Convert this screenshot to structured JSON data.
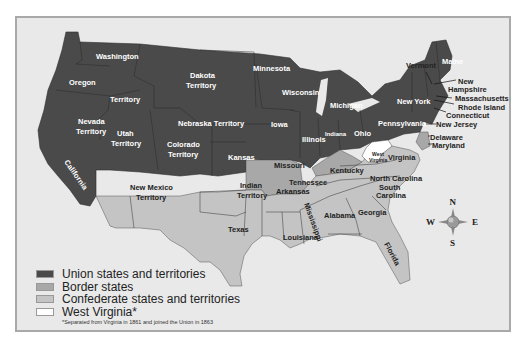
{
  "colors": {
    "union": "#4a4a4a",
    "border": "#a8a8a8",
    "confederate": "#c4c4c4",
    "west_virginia": "#ffffff",
    "background": "#e9e9e9"
  },
  "map": {
    "regions": {
      "washington": "Washington",
      "oregon": "Oregon",
      "territory": "Territory",
      "dakota": [
        "Dakota",
        "Territory"
      ],
      "minnesota": "Minnesota",
      "wisconsin": "Wisconsin",
      "michigan": "Michigan",
      "nevada": [
        "Nevada",
        "Territory"
      ],
      "utah": [
        "Utah",
        "Territory"
      ],
      "nebraska": "Nebraska Territory",
      "iowa": "Iowa",
      "illinois": "Illinois",
      "indiana": "Indiana",
      "ohio": "Ohio",
      "california": "California",
      "colorado": [
        "Colorado",
        "Territory"
      ],
      "kansas": "Kansas",
      "missouri": "Missouri",
      "kentucky": "Kentucky",
      "west_virginia": [
        "West",
        "Virginia"
      ],
      "virginia": "Virginia",
      "new_york": "New York",
      "pennsylvania": "Pennsylvania",
      "vermont": "Vermont",
      "maine": "Maine",
      "new_hampshire": [
        "New",
        "Hampshire"
      ],
      "massachusetts": "Massachusetts",
      "rhode_island": "Rhode Island",
      "connecticut": "Connecticut",
      "new_jersey": "New Jersey",
      "delaware": "Delaware",
      "maryland": "Maryland",
      "new_mexico": [
        "New Mexico",
        "Territory"
      ],
      "indian": [
        "Indian",
        "Territory"
      ],
      "texas": "Texas",
      "arkansas": "Arkansas",
      "louisiana": "Louisiana",
      "mississippi": "Mississippi",
      "tennessee": "Tennessee",
      "alabama": "Alabama",
      "georgia": "Georgia",
      "north_carolina": "North Carolina",
      "south_carolina": [
        "South",
        "Carolina"
      ],
      "florida": "Florida"
    },
    "compass": {
      "n": "N",
      "s": "S",
      "e": "E",
      "w": "W"
    }
  },
  "legend": {
    "items": [
      {
        "label": "Union states and territories",
        "color": "#4a4a4a"
      },
      {
        "label": "Border states",
        "color": "#a8a8a8"
      },
      {
        "label": "Confederate states and territories",
        "color": "#c4c4c4"
      },
      {
        "label": "West Virginia*",
        "color": "#ffffff"
      }
    ],
    "footnote": "*Separated from Virginia in 1861 and joined the Union in 1863"
  }
}
